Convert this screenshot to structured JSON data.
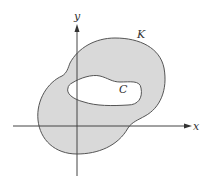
{
  "diagram": {
    "axes": {
      "x_label": "x",
      "y_label": "y"
    },
    "regions": {
      "outer_curve_label": "K",
      "inner_curve_label": "C"
    },
    "colors": {
      "fill": "#d9d9d9",
      "stroke": "#555555",
      "axis": "#444444",
      "hole": "#ffffff"
    }
  }
}
